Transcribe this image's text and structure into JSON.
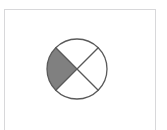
{
  "figure": {
    "panel": {
      "background_color": "#ffffff",
      "border_color": "#d8d8da",
      "x": 4,
      "y": 9,
      "width": 152,
      "height": 121
    }
  },
  "chart_data": {
    "type": "pie",
    "title": "",
    "subtitle": "",
    "xlabel": "",
    "ylabel": "",
    "legend_position": "none",
    "grid": false,
    "center_x": 77,
    "center_y": 69,
    "radius": 30,
    "stroke_color": "#5a5a5a",
    "stroke_width": 1.3,
    "categories": [
      "north",
      "east",
      "south",
      "west"
    ],
    "values": [
      25,
      25,
      25,
      25
    ],
    "series": [
      {
        "name": "sectors",
        "values": [
          25,
          25,
          25,
          25
        ]
      }
    ],
    "sectors": [
      {
        "name": "north-sector",
        "label": "north",
        "start_angle_deg": 225,
        "end_angle_deg": 315,
        "value": 25,
        "fill": "#ffffff",
        "shaded": false
      },
      {
        "name": "east-sector",
        "label": "east",
        "start_angle_deg": 315,
        "end_angle_deg": 45,
        "value": 25,
        "fill": "#ffffff",
        "shaded": false
      },
      {
        "name": "south-sector",
        "label": "south",
        "start_angle_deg": 45,
        "end_angle_deg": 135,
        "value": 25,
        "fill": "#ffffff",
        "shaded": false
      },
      {
        "name": "west-sector",
        "label": "west",
        "start_angle_deg": 135,
        "end_angle_deg": 225,
        "value": 25,
        "fill": "#808080",
        "shaded": true
      }
    ],
    "diagonals": [
      {
        "name": "diagonal-nw-se",
        "x1": 55.8,
        "y1": 47.8,
        "x2": 98.2,
        "y2": 90.2
      },
      {
        "name": "diagonal-ne-sw",
        "x1": 98.2,
        "y1": 47.8,
        "x2": 55.8,
        "y2": 90.2
      }
    ],
    "shaded_fill_color": "#808080",
    "unshaded_fill_color": "#ffffff",
    "outline_color": "#5a5a5a"
  }
}
